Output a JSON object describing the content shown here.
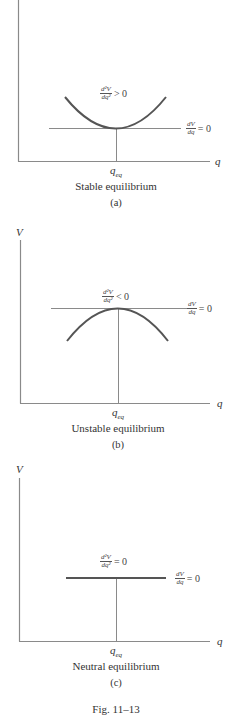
{
  "figure": {
    "caption": "Fig. 11–13",
    "colors": {
      "axis": "#8a8a8a",
      "reference_line": "#8a8a8a",
      "curve": "#555555",
      "text": "#333333"
    }
  },
  "panels": [
    {
      "id": "a",
      "y_axis_label": "V",
      "x_axis_label": "q",
      "equilibrium_label": "q",
      "equilibrium_sub": "eq",
      "curvature_num": "d²V",
      "curvature_den": "dq²",
      "curvature_rel": "> 0",
      "slope_num": "dV",
      "slope_den": "dq",
      "slope_rel": "= 0",
      "title": "Stable equilibrium",
      "tag": "(a)"
    },
    {
      "id": "b",
      "y_axis_label": "V",
      "x_axis_label": "q",
      "equilibrium_label": "q",
      "equilibrium_sub": "eq",
      "curvature_num": "d²V",
      "curvature_den": "dq²",
      "curvature_rel": "< 0",
      "slope_num": "dV",
      "slope_den": "dq",
      "slope_rel": "= 0",
      "title": "Unstable equilibrium",
      "tag": "(b)"
    },
    {
      "id": "c",
      "y_axis_label": "V",
      "x_axis_label": "q",
      "equilibrium_label": "q",
      "equilibrium_sub": "eq",
      "curvature_num": "d²V",
      "curvature_den": "dq²",
      "curvature_rel": "= 0",
      "slope_num": "dV",
      "slope_den": "dq",
      "slope_rel": "= 0",
      "title": "Neutral equilibrium",
      "tag": "(c)"
    }
  ]
}
